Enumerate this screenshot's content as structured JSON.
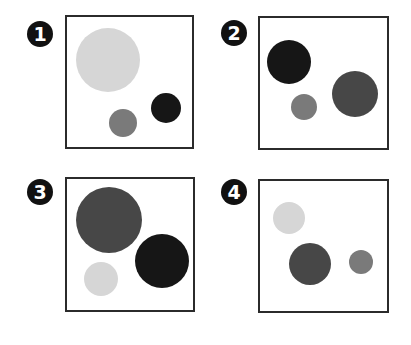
{
  "colors": {
    "light": "#d6d6d6",
    "gray": "#7a7a7a",
    "dark_gray": "#474747",
    "black": "#161616",
    "border": "#2b2b2b"
  },
  "panels": [
    {
      "label": "1",
      "badge": {
        "cx": 40,
        "cy": 34
      },
      "box": {
        "x": 65,
        "y": 15,
        "w": 129,
        "h": 134
      },
      "circles": [
        {
          "shade": "light",
          "cx": 108,
          "cy": 60,
          "r": 32
        },
        {
          "shade": "gray",
          "cx": 123,
          "cy": 123,
          "r": 14
        },
        {
          "shade": "black",
          "cx": 166,
          "cy": 108,
          "r": 15
        }
      ]
    },
    {
      "label": "2",
      "badge": {
        "cx": 234,
        "cy": 33
      },
      "box": {
        "x": 258,
        "y": 16,
        "w": 131,
        "h": 134
      },
      "circles": [
        {
          "shade": "black",
          "cx": 289,
          "cy": 62,
          "r": 22
        },
        {
          "shade": "gray",
          "cx": 304,
          "cy": 107,
          "r": 13
        },
        {
          "shade": "dark_gray",
          "cx": 355,
          "cy": 94,
          "r": 23
        }
      ]
    },
    {
      "label": "3",
      "badge": {
        "cx": 40,
        "cy": 192
      },
      "box": {
        "x": 65,
        "y": 177,
        "w": 130,
        "h": 135
      },
      "circles": [
        {
          "shade": "dark_gray",
          "cx": 109,
          "cy": 220,
          "r": 33
        },
        {
          "shade": "black",
          "cx": 162,
          "cy": 261,
          "r": 27
        },
        {
          "shade": "light",
          "cx": 101,
          "cy": 279,
          "r": 17
        }
      ]
    },
    {
      "label": "4",
      "badge": {
        "cx": 234,
        "cy": 192
      },
      "box": {
        "x": 258,
        "y": 179,
        "w": 131,
        "h": 134
      },
      "circles": [
        {
          "shade": "light",
          "cx": 289,
          "cy": 218,
          "r": 16
        },
        {
          "shade": "dark_gray",
          "cx": 310,
          "cy": 264,
          "r": 21
        },
        {
          "shade": "gray",
          "cx": 361,
          "cy": 262,
          "r": 12
        }
      ]
    }
  ]
}
